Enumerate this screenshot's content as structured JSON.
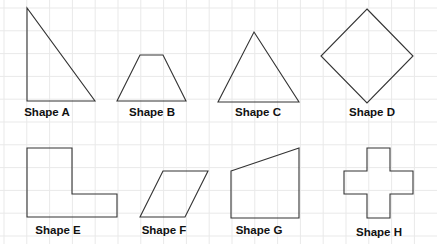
{
  "figure": {
    "background": "#ffffff",
    "grid": {
      "spacing": 22.8,
      "color": "#e9e9e9",
      "origin_x": 4,
      "origin_y": 8
    },
    "stroke_color": "#333333",
    "shapes": [
      {
        "id": "A",
        "label": "Shape A",
        "type": "right-triangle",
        "points": "27,8 27,101 95,101",
        "label_x": 47,
        "label_y": 106
      },
      {
        "id": "B",
        "label": "Shape B",
        "type": "trapezoid",
        "points": "140,55 163,55 186,101 117,101",
        "label_x": 152,
        "label_y": 106
      },
      {
        "id": "C",
        "label": "Shape C",
        "type": "triangle",
        "points": "254,32 299,102 218,102",
        "label_x": 258,
        "label_y": 106
      },
      {
        "id": "D",
        "label": "Shape D",
        "type": "rhombus",
        "points": "367,9 413,56 367,103 321,56",
        "label_x": 372,
        "label_y": 106
      },
      {
        "id": "E",
        "label": "Shape E",
        "type": "l-shape",
        "points": "27,148 72,148 72,194 117,194 117,217 27,217",
        "label_x": 58,
        "label_y": 224
      },
      {
        "id": "F",
        "label": "Shape F",
        "type": "parallelogram",
        "points": "163,171 208,171 185,217 140,217",
        "label_x": 164,
        "label_y": 224
      },
      {
        "id": "G",
        "label": "Shape G",
        "type": "trapezoid",
        "points": "231,171 299,148 299,218 231,218",
        "label_x": 259,
        "label_y": 224
      },
      {
        "id": "H",
        "label": "Shape H",
        "type": "cross",
        "points": "367,148 390,148 390,171 413,171 413,194 390,194 390,218 367,218 367,194 344,194 344,171 367,171",
        "label_x": 379,
        "label_y": 226
      }
    ]
  }
}
